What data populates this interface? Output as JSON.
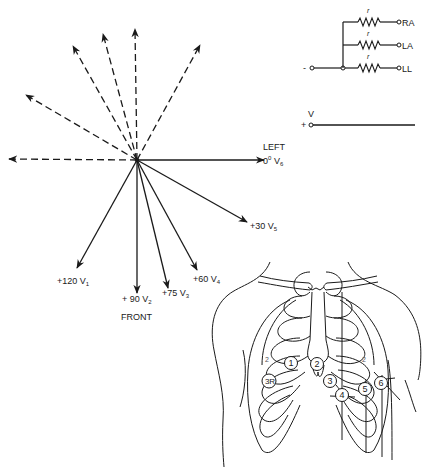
{
  "figure": {
    "axis_diagram": {
      "directions": {
        "left_label": "LEFT",
        "front_label": "FRONT"
      },
      "precordial_leads": [
        {
          "id": "V6",
          "angle_label": "0",
          "degree_symbol": "0",
          "lead": "V",
          "sub": "6",
          "angle_deg": 0
        },
        {
          "id": "V5",
          "angle_label": "+30",
          "lead": "V",
          "sub": "5",
          "angle_deg": 30
        },
        {
          "id": "V4",
          "angle_label": "+60",
          "lead": "V",
          "sub": "4",
          "angle_deg": 60
        },
        {
          "id": "V3",
          "angle_label": "+75",
          "lead": "V",
          "sub": "3",
          "angle_deg": 75
        },
        {
          "id": "V2",
          "angle_label": "+ 90",
          "lead": "V",
          "sub": "2",
          "angle_deg": 90
        },
        {
          "id": "V1",
          "angle_label": "+120",
          "lead": "V",
          "sub": "1",
          "angle_deg": 120
        }
      ],
      "negative_directions_dashed": 6
    },
    "central_terminal": {
      "resistor_label": "r",
      "terminals": [
        "RA",
        "LA",
        "LL"
      ],
      "negative_symbol": "-",
      "positive_symbol": "+",
      "exploring_electrode_label": "V"
    },
    "chest": {
      "electrodes": [
        "1",
        "2",
        "3",
        "4",
        "5",
        "6"
      ],
      "right_sided_electrode": "3R",
      "intercostal_marker": "2"
    }
  }
}
